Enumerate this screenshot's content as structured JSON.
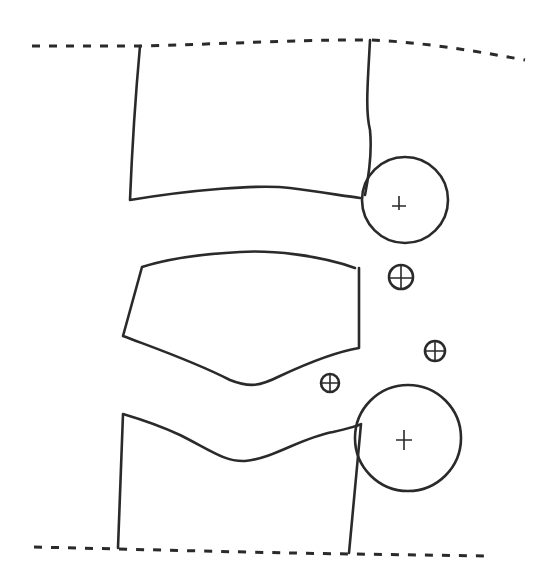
{
  "diagram": {
    "type": "line-drawing",
    "stroke_color": "#2a2a2a",
    "background": "#ffffff",
    "elements": [
      {
        "id": "top-boundary",
        "kind": "dashed-line"
      },
      {
        "id": "upper-block",
        "kind": "shape"
      },
      {
        "id": "middle-block",
        "kind": "shape"
      },
      {
        "id": "lower-block",
        "kind": "shape"
      },
      {
        "id": "bottom-boundary",
        "kind": "dashed-line"
      },
      {
        "id": "large-circle-upper",
        "kind": "circle",
        "marker": "+"
      },
      {
        "id": "large-circle-lower",
        "kind": "circle",
        "marker": "+"
      },
      {
        "id": "small-marker-1",
        "kind": "circled-plus"
      },
      {
        "id": "small-marker-2",
        "kind": "circled-plus"
      },
      {
        "id": "small-marker-3",
        "kind": "circled-plus"
      }
    ]
  }
}
